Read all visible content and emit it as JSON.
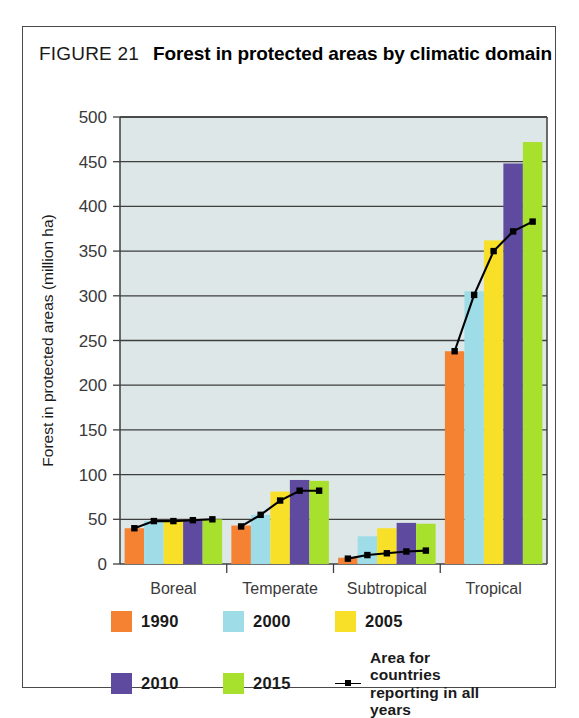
{
  "figure": {
    "number": "FIGURE 21",
    "title": "Forest in protected areas by climatic domain"
  },
  "legend": {
    "entries": [
      {
        "label": "1990",
        "color": "#F58233"
      },
      {
        "label": "2000",
        "color": "#9EDDE8"
      },
      {
        "label": "2005",
        "color": "#F8E029"
      },
      {
        "label": "2010",
        "color": "#5E4A9E"
      },
      {
        "label": "2015",
        "color": "#A8E02E"
      }
    ],
    "line_entry": {
      "label": "Area for countries\nreporting in all years",
      "color": "#000000"
    }
  },
  "colors": {
    "plot_background": "#dde7e7",
    "gridline": "#3f3f3f",
    "axis": "#3f3f3f",
    "text": "#3a3a3a"
  },
  "chart_data": {
    "type": "bar",
    "title": "Forest in protected areas by climatic domain",
    "xlabel": "",
    "ylabel": "Forest in protected areas (million ha)",
    "ylim": [
      0,
      500
    ],
    "yticks": [
      0,
      50,
      100,
      150,
      200,
      250,
      300,
      350,
      400,
      450,
      500
    ],
    "ytick_labels": [
      "0",
      "50",
      "100",
      "150",
      "200",
      "250",
      "300",
      "350",
      "400",
      "450",
      "500"
    ],
    "grid": true,
    "legend_position": "bottom",
    "categories": [
      "Boreal",
      "Temperate",
      "Subtropical",
      "Tropical"
    ],
    "series": [
      {
        "name": "1990",
        "color": "#F58233",
        "values": [
          40,
          43,
          7,
          238
        ]
      },
      {
        "name": "2000",
        "color": "#9EDDE8",
        "values": [
          48,
          55,
          31,
          305
        ]
      },
      {
        "name": "2005",
        "color": "#F8E029",
        "values": [
          48,
          81,
          40,
          362
        ]
      },
      {
        "name": "2010",
        "color": "#5E4A9E",
        "values": [
          49,
          94,
          46,
          448
        ]
      },
      {
        "name": "2015",
        "color": "#A8E02E",
        "values": [
          50,
          93,
          45,
          472
        ]
      }
    ],
    "line_series": {
      "name": "Area for countries reporting in all years",
      "color": "#000000",
      "marker": "square",
      "values": [
        [
          40,
          48,
          48,
          49,
          50
        ],
        [
          42,
          55,
          71,
          82,
          82
        ],
        [
          6,
          10,
          12,
          14,
          15
        ],
        [
          238,
          301,
          350,
          372,
          383
        ]
      ]
    }
  }
}
